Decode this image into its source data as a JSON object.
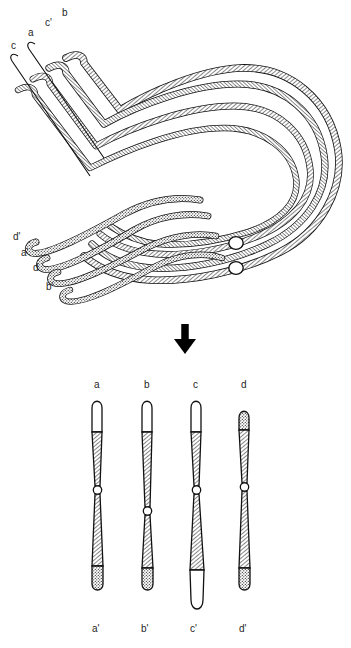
{
  "figure": {
    "panels": [
      {
        "name": "upper-panel",
        "description": "pachytene quadrivalent loop with four synapsed strands and two centromeres"
      },
      {
        "name": "lower-panel",
        "description": "four resulting metaphase chromosomes"
      }
    ]
  },
  "upper_panel": {
    "top_labels": [
      {
        "id": "c",
        "text": "c",
        "x": 11,
        "y": 41
      },
      {
        "id": "a",
        "text": "a",
        "x": 28,
        "y": 28
      },
      {
        "id": "cp",
        "text": "c'",
        "x": 45,
        "y": 18
      },
      {
        "id": "b",
        "text": "b",
        "x": 62,
        "y": 8
      }
    ],
    "bottom_labels": [
      {
        "id": "dp",
        "text": "d'",
        "x": 13,
        "y": 232
      },
      {
        "id": "ap",
        "text": "a'",
        "x": 21,
        "y": 248
      },
      {
        "id": "d",
        "text": "d",
        "x": 33,
        "y": 263
      },
      {
        "id": "bp",
        "text": "b'",
        "x": 46,
        "y": 282
      }
    ],
    "centromeres": [
      {
        "id": "centromere-upper",
        "cx": 236,
        "cy": 243
      },
      {
        "id": "centromere-lower",
        "cx": 236,
        "cy": 268
      }
    ],
    "strand_count": 4
  },
  "arrow": {
    "name": "downward-arrow",
    "direction": "down",
    "x": 185,
    "y_top": 325,
    "y_bottom": 353,
    "color": "#000000"
  },
  "lower_panel": {
    "top_labels": [
      {
        "id": "a",
        "text": "a",
        "x": 94,
        "y": 380
      },
      {
        "id": "b",
        "text": "b",
        "x": 144,
        "y": 380
      },
      {
        "id": "c",
        "text": "c",
        "x": 193,
        "y": 380
      },
      {
        "id": "d",
        "text": "d",
        "x": 241,
        "y": 380
      }
    ],
    "bottom_labels": [
      {
        "id": "ap",
        "text": "a'",
        "x": 92,
        "y": 624
      },
      {
        "id": "bp",
        "text": "b'",
        "x": 141,
        "y": 624
      },
      {
        "id": "cp",
        "text": "c'",
        "x": 190,
        "y": 624
      },
      {
        "id": "dp",
        "text": "d'",
        "x": 239,
        "y": 624
      }
    ],
    "chromosomes": [
      {
        "id": "chromosome-a",
        "top_label": "a",
        "bottom_label": "a'",
        "cx": 97,
        "top": 398,
        "bottom": 592,
        "centromere_y": 490,
        "top_tip": "white",
        "bottom_tip": "stippled",
        "body": "hatched"
      },
      {
        "id": "chromosome-b",
        "top_label": "b",
        "bottom_label": "b'",
        "cx": 147,
        "top": 398,
        "bottom": 592,
        "centromere_y": 511,
        "top_tip": "white",
        "bottom_tip": "stippled",
        "body": "hatched"
      },
      {
        "id": "chromosome-c",
        "top_label": "c",
        "bottom_label": "c'",
        "cx": 196,
        "top": 398,
        "bottom": 612,
        "centromere_y": 490,
        "top_tip": "white",
        "bottom_tip": "white",
        "body": "hatched"
      },
      {
        "id": "chromosome-d",
        "top_label": "d",
        "bottom_label": "d'",
        "cx": 244,
        "top": 408,
        "bottom": 592,
        "centromere_y": 487,
        "top_tip": "stippled",
        "bottom_tip": "stippled",
        "body": "hatched"
      }
    ]
  },
  "colors": {
    "stroke": "#111111",
    "fill_white": "#ffffff",
    "hatch": "#333333",
    "stipple": "#2b2b2b",
    "label": "#262626",
    "background": "#ffffff"
  }
}
